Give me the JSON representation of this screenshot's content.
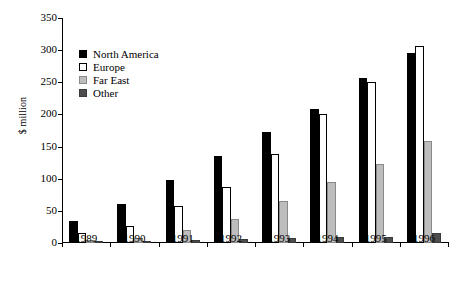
{
  "chart_data": {
    "type": "bar",
    "title": "",
    "xlabel": "",
    "ylabel": "$ million",
    "categories": [
      "1989",
      "1990",
      "1991",
      "1992",
      "1993",
      "1994",
      "1995",
      "1996"
    ],
    "series": [
      {
        "name": "North America",
        "color": "#000000",
        "values": [
          35,
          60,
          98,
          135,
          172,
          208,
          256,
          296
        ]
      },
      {
        "name": "Europe",
        "color": "#ffffff",
        "values": [
          16,
          27,
          57,
          87,
          138,
          200,
          250,
          306
        ]
      },
      {
        "name": "Far East",
        "color": "#bdbdbd",
        "values": [
          4,
          8,
          20,
          38,
          65,
          95,
          123,
          158
        ]
      },
      {
        "name": "Other",
        "color": "#4d4d4d",
        "values": [
          2,
          3,
          4,
          6,
          8,
          9,
          10,
          15
        ]
      }
    ],
    "ylim": [
      0,
      350
    ],
    "yticks": [
      0,
      50,
      100,
      150,
      200,
      250,
      300,
      350
    ],
    "ytick_labels": [
      "0",
      "50",
      "100",
      "150",
      "200",
      "250",
      "300",
      "350"
    ],
    "grid": false,
    "legend_position": "upper-left-inside"
  }
}
